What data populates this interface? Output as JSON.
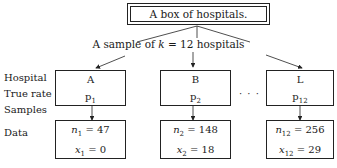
{
  "title": "A box of hospitals.",
  "sample_label": {
    "prefix": "A sample of ",
    "k_var": "k",
    "suffix": " = 12 hospitals"
  },
  "row_labels": [
    "Hospital",
    "True rate",
    "Samples",
    "Data"
  ],
  "hospitals": [
    {
      "name": "A",
      "rate_var": "p",
      "rate_sub": "1",
      "n_sub": "1",
      "n_val": " = 47",
      "x_sub": "1",
      "x_val": " = 0"
    },
    {
      "name": "B",
      "rate_var": "p",
      "rate_sub": "2",
      "n_sub": "2",
      "n_val": " = 148",
      "x_sub": "2",
      "x_val": " = 18"
    },
    {
      "name": "L",
      "rate_var": "p",
      "rate_sub": "12",
      "n_sub": "12",
      "n_val": " = 256",
      "x_sub": "12",
      "x_val": " = 29"
    }
  ],
  "ellipsis": "· · ·"
}
